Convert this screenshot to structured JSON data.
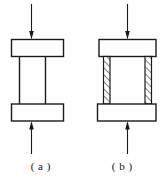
{
  "figure": {
    "type": "engineering-diagram",
    "stroke_color": "#1a1a1a",
    "fill_color": "#ffffff",
    "background_color": "#ffffff",
    "subfigures": [
      {
        "id": "a",
        "caption": "( a )",
        "label_text": "(a)",
        "load_arrow_top": "downward-arrow",
        "load_arrow_bottom": "upward-arrow",
        "top_plate": "rectangular-plate",
        "bottom_plate": "rectangular-plate",
        "column": "plain-column",
        "hatched": false
      },
      {
        "id": "b",
        "caption": "( b )",
        "label_text": "(b)",
        "load_arrow_top": "downward-arrow",
        "load_arrow_bottom": "upward-arrow",
        "top_plate": "rectangular-plate",
        "bottom_plate": "rectangular-plate",
        "column": "column-with-hatched-side-strips",
        "hatched": true,
        "hatch_pattern": "diagonal-lines"
      }
    ]
  }
}
